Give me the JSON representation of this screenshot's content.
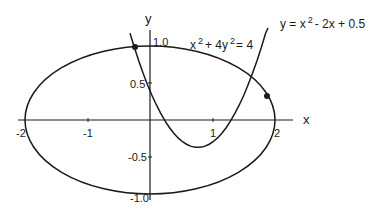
{
  "diagram": {
    "type": "function-plot",
    "axes": {
      "x_label": "x",
      "y_label": "y",
      "x_ticks": [
        {
          "value": -2,
          "label": "-2"
        },
        {
          "value": -1,
          "label": "-1"
        },
        {
          "value": 1,
          "label": "1"
        },
        {
          "value": 2,
          "label": "2"
        }
      ],
      "y_ticks": [
        {
          "value": 1.0,
          "label": "1.0"
        },
        {
          "value": 0.5,
          "label": "0.5"
        },
        {
          "value": -0.5,
          "label": "-0.5"
        },
        {
          "value": -1.0,
          "label": "-1.0"
        }
      ]
    },
    "curves": [
      {
        "name": "ellipse",
        "equation": "x^2 + 4y^2 = 4",
        "label_main": "x",
        "label_sup1": "2",
        "label_mid": "+ 4y",
        "label_sup2": "2",
        "label_end": "= 4"
      },
      {
        "name": "parabola",
        "equation": "y = x^2 - 2x + 0.5",
        "label_pre": "y = x",
        "label_sup": "2",
        "label_post": "- 2x + 0.5"
      }
    ],
    "intersection_points": [
      {
        "x": -0.2,
        "y": 0.99
      },
      {
        "x": 1.9,
        "y": -0.3
      }
    ],
    "colors": {
      "curve": "#1a1a1a",
      "axis": "#1a1a1a",
      "background": "#ffffff"
    }
  }
}
